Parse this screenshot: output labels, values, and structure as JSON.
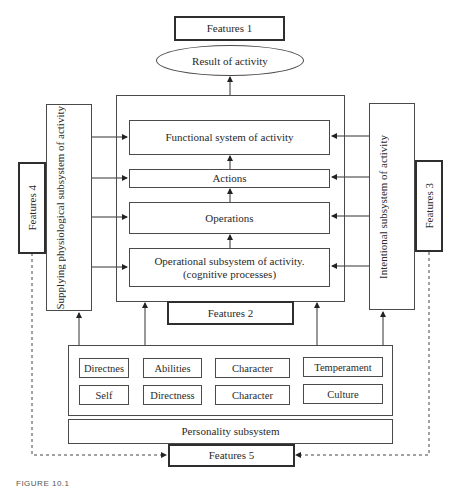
{
  "diagram": {
    "features_1": "Features 1",
    "result": "Result of activity",
    "left_subsystem": "Supplying physiological subsystem of activity",
    "right_subsystem": "Intentional subsystem of activity",
    "features_4": "Features 4",
    "features_3": "Features 3",
    "features_2": "Features 2",
    "features_5": "Features 5",
    "core": {
      "functional": "Functional system of activity",
      "actions": "Actions",
      "operations": "Operations",
      "operational_line1": "Operational subsystem of activity.",
      "operational_line2": "(cognitive processes)"
    },
    "traits": {
      "row1": [
        "Directnes",
        "Abilities",
        "Character",
        "Temperament"
      ],
      "row2": [
        "Self",
        "Directness",
        "Character",
        "Culture"
      ]
    },
    "personality": "Personality subsystem",
    "caption": "FIGURE 10.1"
  }
}
